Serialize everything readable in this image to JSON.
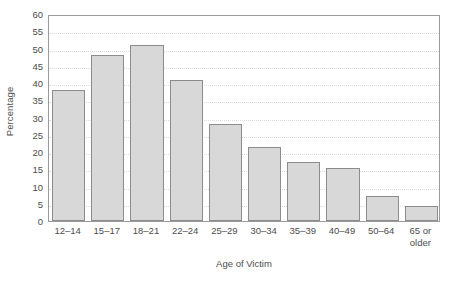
{
  "chart_data": {
    "type": "bar",
    "title": "",
    "xlabel": "Age of Victim",
    "ylabel": "Percentage",
    "categories": [
      "12–14",
      "15–17",
      "18–21",
      "22–24",
      "25–29",
      "30–34",
      "35–39",
      "40–49",
      "50–64",
      "65 or older"
    ],
    "category_lines": [
      [
        "12–14"
      ],
      [
        "15–17"
      ],
      [
        "18–21"
      ],
      [
        "22–24"
      ],
      [
        "25–29"
      ],
      [
        "30–34"
      ],
      [
        "35–39"
      ],
      [
        "40–49"
      ],
      [
        "50–64"
      ],
      [
        "65 or",
        "older"
      ]
    ],
    "values": [
      38,
      48,
      51,
      41,
      28,
      21.5,
      17,
      15.3,
      7.2,
      4.3
    ],
    "ylim": [
      0,
      60
    ],
    "ytick_values": [
      0,
      5,
      10,
      15,
      20,
      25,
      30,
      35,
      40,
      45,
      50,
      55,
      60
    ],
    "ytick_labels": [
      "0",
      "5",
      "10",
      "15",
      "20",
      "25",
      "30",
      "35",
      "40",
      "45",
      "50",
      "55",
      "60"
    ],
    "grid": "horizontal",
    "legend": "none",
    "bar_fill_color": "#d8d8d8",
    "bar_border_color": "#8c8c8c",
    "frame_color": "#9a9a9a",
    "gridline_color": "#dcdcdc"
  }
}
